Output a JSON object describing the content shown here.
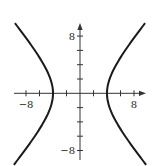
{
  "chart_data": {
    "type": "line",
    "title": "",
    "xlabel": "",
    "ylabel": "",
    "xlim": [
      -10,
      10
    ],
    "ylim": [
      -10,
      10
    ],
    "grid": false,
    "equation": "x^2/16 - y^2/20 = 1",
    "x_ticks": [
      -8,
      -6,
      -4,
      -2,
      2,
      4,
      6,
      8
    ],
    "y_ticks": [
      -8,
      -6,
      -4,
      -2,
      2,
      4,
      6,
      8
    ],
    "x_tick_labels": [
      {
        "value": -8,
        "text": "−8"
      },
      {
        "value": 8,
        "text": "8"
      }
    ],
    "y_tick_labels": [
      {
        "value": 8,
        "text": "8"
      },
      {
        "value": -8,
        "text": "−8"
      }
    ],
    "series": [
      {
        "name": "right-branch",
        "a": 4,
        "b2": 20,
        "sign": 1,
        "y_range": [
          -10,
          9.8
        ]
      },
      {
        "name": "left-branch",
        "a": 4,
        "b2": 20,
        "sign": -1,
        "y_range": [
          -10,
          9.8
        ]
      }
    ],
    "colors": {
      "curve": "#1a1a1a",
      "axis": "#333333"
    }
  }
}
